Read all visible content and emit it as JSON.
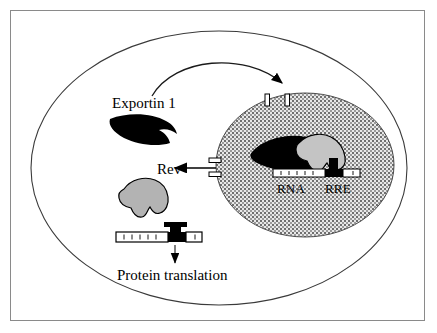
{
  "figure": {
    "background_color": "#ffffff",
    "frame_color": "#8a8a8a"
  },
  "labels": {
    "exportin": "Exportin 1",
    "rev": "Rev",
    "rna": "RNA",
    "rre": "RRE",
    "protein_translation": "Protein translation"
  },
  "colors": {
    "outline": "#000000",
    "exportin_fill": "#000000",
    "rev_fill": "#b3b3b3",
    "nucleus_stipple_dark": "#6e6e6e",
    "nucleus_stipple_light": "#dcdcdc",
    "membrane_stroke": "#3a3a3a",
    "arrow": "#000000",
    "rna_white": "#ffffff",
    "rre_black": "#000000"
  },
  "structures": {
    "cell_membrane": "cell-membrane-ellipse",
    "nucleus": "nucleus-ellipse",
    "nuclear_pore_top": "nuclear-pore-import",
    "nuclear_pore_left": "nuclear-pore-export",
    "exportin_cytoplasm": "exportin-crescent-cytoplasmic",
    "exportin_nucleus": "exportin-crescent-nuclear",
    "rev_cytoplasm": "rev-blob-cytoplasmic",
    "rev_nucleus": "rev-blob-nuclear",
    "rna_nuclear": "rna-strand-nuclear",
    "rna_cytoplasmic": "rna-strand-cytoplasmic",
    "rre_stemloop_nuclear": "rre-stem-loop-nuclear",
    "rre_stemloop_cytoplasmic": "rre-stem-loop-cytoplasmic"
  },
  "arrows": {
    "import_arc": "exportin-import-arc-to-nucleus",
    "export_arrow": "rnp-export-arrow-to-cytoplasm",
    "translation_arrow": "mrna-to-protein-translation-arrow"
  },
  "rna_ticks": {
    "nuclear_count": 5,
    "cytoplasmic_count": 6
  }
}
